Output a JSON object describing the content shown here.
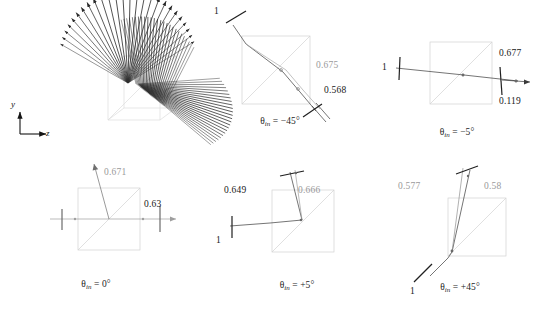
{
  "figure": {
    "type": "optics-ray-diagram-multipanel",
    "background_color": "#ffffff",
    "ray_color": "#2a2a2a",
    "gray_ray_color": "#b9b9b9",
    "cube_outline_color": "#cfcfcf",
    "value_black_color": "#202020",
    "value_gray_color": "#9a9a9a"
  },
  "axes_indicator": {
    "name": "y-z-axis-indicator",
    "y_label": "y",
    "z_label": "z"
  },
  "panels": [
    {
      "id": "fan-3d",
      "caption": "",
      "values": []
    },
    {
      "id": "theta-minus-45",
      "caption_theta": "θ",
      "caption_sub": "in",
      "caption_eq": " = −45°",
      "caption_full": "θin = −45°",
      "values": [
        {
          "text": "1",
          "tone": "black"
        },
        {
          "text": "0.675",
          "tone": "gray"
        },
        {
          "text": "0.568",
          "tone": "black"
        }
      ]
    },
    {
      "id": "theta-minus-5",
      "caption_theta": "θ",
      "caption_sub": "in",
      "caption_eq": " = −5°",
      "caption_full": "θin = −5°",
      "values": [
        {
          "text": "1",
          "tone": "black"
        },
        {
          "text": "0.677",
          "tone": "black"
        },
        {
          "text": "0.119",
          "tone": "black"
        }
      ]
    },
    {
      "id": "theta-0",
      "caption_theta": "θ",
      "caption_sub": "in",
      "caption_eq": " = 0°",
      "caption_full": "θin = 0°",
      "values": [
        {
          "text": "0.671",
          "tone": "gray"
        },
        {
          "text": "0.63",
          "tone": "black"
        }
      ]
    },
    {
      "id": "theta-plus-5",
      "caption_theta": "θ",
      "caption_sub": "in",
      "caption_eq": " = +5°",
      "caption_full": "θin = +5°",
      "values": [
        {
          "text": "0.649",
          "tone": "black"
        },
        {
          "text": "0.666",
          "tone": "gray"
        },
        {
          "text": "1",
          "tone": "black"
        }
      ]
    },
    {
      "id": "theta-plus-45",
      "caption_theta": "θ",
      "caption_sub": "in",
      "caption_eq": " = +45°",
      "caption_full": "θin = +45°",
      "values": [
        {
          "text": "0.577",
          "tone": "gray"
        },
        {
          "text": "0.58",
          "tone": "gray"
        },
        {
          "text": "1",
          "tone": "black"
        }
      ]
    }
  ],
  "labels": {
    "p45n_in": "1",
    "p45n_mid": "0.675",
    "p45n_out": "0.568",
    "p5n_in": "1",
    "p5n_top": "0.677",
    "p5n_bot": "0.119",
    "p0_up": "0.671",
    "p0_right": "0.63",
    "p5p_left": "0.649",
    "p5p_right": "0.666",
    "p5p_in": "1",
    "p45p_left": "0.577",
    "p45p_right": "0.58",
    "p45p_in": "1"
  },
  "captions": {
    "c_minus45": "θ",
    "c_minus45_sub": "in",
    "c_minus45_rest": " = −45°",
    "c_minus5": "θ",
    "c_minus5_sub": "in",
    "c_minus5_rest": " = −5°",
    "c_zero": "θ",
    "c_zero_sub": "in",
    "c_zero_rest": " = 0°",
    "c_plus5": "θ",
    "c_plus5_sub": "in",
    "c_plus5_rest": " = +5°",
    "c_plus45": "θ",
    "c_plus45_sub": "in",
    "c_plus45_rest": " = +45°"
  },
  "chart_data": {
    "type": "scatter",
    "title": "",
    "categories": [
      "−45°",
      "−5°",
      "0°",
      "+5°",
      "+45°"
    ],
    "series": [
      {
        "name": "input",
        "values": [
          1,
          1,
          1,
          1,
          1
        ]
      },
      {
        "name": "branch-a",
        "values": [
          0.675,
          0.677,
          0.671,
          0.666,
          0.58
        ]
      },
      {
        "name": "branch-b",
        "values": [
          0.568,
          0.119,
          0.63,
          0.649,
          0.577
        ]
      }
    ],
    "xlabel": "θin",
    "ylabel": "relative power",
    "ylim": [
      0,
      1
    ]
  }
}
